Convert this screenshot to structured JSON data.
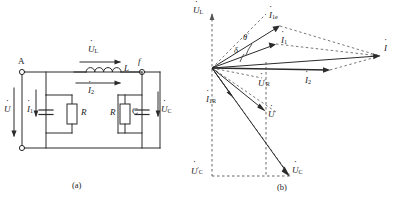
{
  "figure": {
    "panels": [
      {
        "id": "a",
        "caption": "(a)",
        "type": "circuit-schematic"
      },
      {
        "id": "b",
        "caption": "(b)",
        "type": "phasor-diagram"
      }
    ]
  },
  "circuit": {
    "terminals": [
      {
        "name": "A",
        "label": "A",
        "position": "top-left"
      },
      {
        "name": "f",
        "label": "f",
        "position": "top-right"
      }
    ],
    "source": {
      "label_symbol": "U",
      "label_dot": true,
      "name": "supply-voltage"
    },
    "branch_currents": [
      {
        "label_symbol": "I",
        "subscript": "1",
        "name": "current-i1"
      },
      {
        "label_symbol": "I",
        "subscript": "2",
        "name": "current-i2"
      }
    ],
    "components": [
      {
        "name": "capacitor-left",
        "label": "",
        "kind": "capacitor"
      },
      {
        "name": "resistor-left",
        "label": "R",
        "kind": "resistor"
      },
      {
        "name": "inductor",
        "label": "L",
        "kind": "inductor"
      },
      {
        "name": "resistor-right",
        "label": "R",
        "kind": "resistor"
      },
      {
        "name": "capacitor-right",
        "label": "C",
        "kind": "capacitor"
      }
    ],
    "drops": [
      {
        "label_symbol": "U",
        "subscript": "L",
        "name": "inductor-voltage"
      },
      {
        "label_symbol": "U",
        "subscript": "C",
        "name": "capacitor-voltage"
      }
    ]
  },
  "phasor": {
    "axis_labels": [
      {
        "symbol": "U",
        "subscript": "L",
        "prime": false,
        "name": "axis-label-ul",
        "position": "top"
      },
      {
        "symbol": "U",
        "subscript": "C",
        "prime": true,
        "name": "axis-label-uc-prime",
        "position": "bottom-left"
      }
    ],
    "vectors": [
      {
        "symbol": "I",
        "subscript": "1e",
        "prime": false,
        "name": "phasor-i1e",
        "style": "solid"
      },
      {
        "symbol": "I",
        "subscript": "1",
        "prime": false,
        "name": "phasor-i1",
        "style": "solid"
      },
      {
        "symbol": "I",
        "subscript": "2",
        "prime": false,
        "name": "phasor-i2",
        "style": "solid"
      },
      {
        "symbol": "I",
        "subscript": "",
        "prime": false,
        "name": "phasor-i",
        "style": "solid"
      },
      {
        "symbol": "I",
        "subscript": "1R",
        "prime": false,
        "name": "phasor-i1r",
        "style": "solid"
      },
      {
        "symbol": "U",
        "subscript": "R",
        "prime": true,
        "name": "phasor-ur-prime",
        "style": "dashed"
      },
      {
        "symbol": "U",
        "subscript": "",
        "prime": false,
        "name": "phasor-u",
        "style": "solid"
      },
      {
        "symbol": "U",
        "subscript": "C",
        "prime": false,
        "name": "phasor-uc",
        "style": "solid"
      }
    ],
    "angles": [
      {
        "label": "θ",
        "prime": true,
        "name": "angle-theta-prime"
      },
      {
        "label": "δ",
        "prime": false,
        "name": "angle-delta"
      }
    ]
  },
  "colors": {
    "ink": "#1a1a1a",
    "line": "#2b2b2b",
    "dashed": "#555555",
    "background": "#ffffff"
  }
}
